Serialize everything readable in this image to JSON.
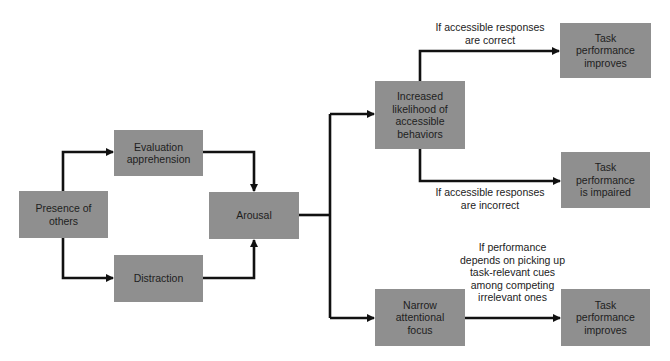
{
  "diagram": {
    "type": "flowchart",
    "nodes": {
      "presence": "Presence of\nothers",
      "evaluation": "Evaluation\napprehension",
      "distraction": "Distraction",
      "arousal": "Arousal",
      "increased": "Increased\nlikelihood of\naccessible\nbehaviors",
      "narrow": "Narrow\nattentional\nfocus",
      "task_improves_1": "Task\nperformance\nimproves",
      "task_impaired": "Task\nperformance\nis impaired",
      "task_improves_2": "Task\nperformance\nimproves"
    },
    "edge_labels": {
      "correct": "If accessible responses\nare correct",
      "incorrect": "If accessible responses\nare incorrect",
      "cues": "If performance\ndepends on picking up\ntask-relevant cues\namong competing\nirrelevant ones"
    },
    "colors": {
      "box_fill": "#8f8f8f",
      "line": "#111111",
      "text": "#1e1e1e"
    }
  }
}
